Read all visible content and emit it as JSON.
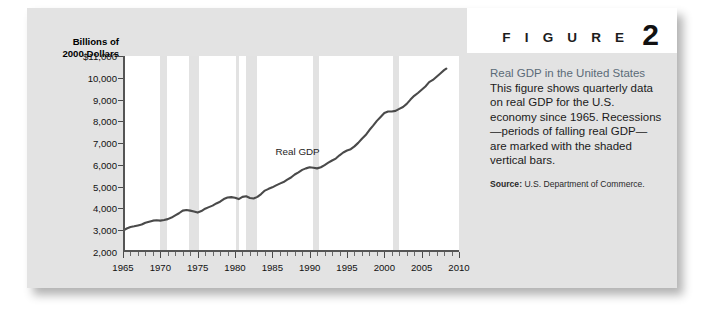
{
  "figure": {
    "word": "F I G U R E",
    "number": "2"
  },
  "caption": {
    "title": "Real GDP in the United States",
    "body": "This figure shows quarterly data on real GDP for the U.S. economy since 1965. Recessions—periods of falling real GDP—are marked with the shaded vertical bars.",
    "source_label": "Source:",
    "source_text": " U.S. Department of Commerce."
  },
  "chart_data": {
    "type": "line",
    "title": "Real GDP in the United States",
    "xlabel": "",
    "ylabel": "Billions of 2000 Dollars",
    "ylabel_line1": "Billions of",
    "ylabel_line2": "2000 Dollars",
    "series_label": "Real GDP",
    "xlim": [
      1965,
      2010
    ],
    "ylim": [
      2000,
      11000
    ],
    "xticks": [
      1965,
      1970,
      1975,
      1980,
      1985,
      1990,
      1995,
      2000,
      2005,
      2010
    ],
    "xtick_labels": [
      "1965",
      "1970",
      "1975",
      "1980",
      "1985",
      "1990",
      "1995",
      "2000",
      "2005",
      "2010"
    ],
    "yticks": [
      2000,
      3000,
      4000,
      5000,
      6000,
      7000,
      8000,
      9000,
      10000,
      11000
    ],
    "ytick_labels": [
      "2,000",
      "3,000",
      "4,000",
      "5,000",
      "6,000",
      "7,000",
      "8,000",
      "9,000",
      "10,000",
      "$11,000"
    ],
    "grid": false,
    "legend": "inline",
    "line_color": "#4a4a4a",
    "recession_color": "#e2e2e2",
    "recession_bands": [
      {
        "start": 1969.9,
        "end": 1970.9,
        "label": "1970 recession"
      },
      {
        "start": 1973.9,
        "end": 1975.2,
        "label": "1973-75 recession"
      },
      {
        "start": 1980.1,
        "end": 1980.6,
        "label": "1980 recession"
      },
      {
        "start": 1981.5,
        "end": 1982.9,
        "label": "1981-82 recession"
      },
      {
        "start": 1990.5,
        "end": 1991.2,
        "label": "1990-91 recession"
      },
      {
        "start": 2001.2,
        "end": 2001.9,
        "label": "2001 recession"
      }
    ],
    "x": [
      1965.0,
      1965.5,
      1966.0,
      1966.5,
      1967.0,
      1967.5,
      1968.0,
      1968.5,
      1969.0,
      1969.5,
      1970.0,
      1970.5,
      1971.0,
      1971.5,
      1972.0,
      1972.5,
      1973.0,
      1973.5,
      1974.0,
      1974.5,
      1975.0,
      1975.5,
      1976.0,
      1976.5,
      1977.0,
      1977.5,
      1978.0,
      1978.5,
      1979.0,
      1979.5,
      1980.0,
      1980.5,
      1981.0,
      1981.5,
      1982.0,
      1982.5,
      1983.0,
      1983.5,
      1984.0,
      1984.5,
      1985.0,
      1985.5,
      1986.0,
      1986.5,
      1987.0,
      1987.5,
      1988.0,
      1988.5,
      1989.0,
      1989.5,
      1990.0,
      1990.5,
      1991.0,
      1991.5,
      1992.0,
      1992.5,
      1993.0,
      1993.5,
      1994.0,
      1994.5,
      1995.0,
      1995.5,
      1996.0,
      1996.5,
      1997.0,
      1997.5,
      1998.0,
      1998.5,
      1999.0,
      1999.5,
      2000.0,
      2000.5,
      2001.0,
      2001.5,
      2002.0,
      2002.5,
      2003.0,
      2003.5,
      2004.0,
      2004.5,
      2005.0,
      2005.5,
      2006.0,
      2006.5,
      2007.0,
      2007.5,
      2008.0,
      2008.3
    ],
    "values": [
      2980,
      3080,
      3150,
      3180,
      3220,
      3260,
      3340,
      3390,
      3440,
      3460,
      3440,
      3470,
      3510,
      3580,
      3680,
      3780,
      3900,
      3930,
      3900,
      3860,
      3810,
      3880,
      3990,
      4060,
      4130,
      4230,
      4310,
      4430,
      4500,
      4520,
      4490,
      4430,
      4530,
      4560,
      4480,
      4460,
      4530,
      4660,
      4820,
      4900,
      4970,
      5060,
      5140,
      5210,
      5320,
      5420,
      5560,
      5660,
      5770,
      5840,
      5890,
      5870,
      5840,
      5890,
      5990,
      6100,
      6200,
      6290,
      6440,
      6570,
      6660,
      6720,
      6850,
      7010,
      7200,
      7370,
      7600,
      7800,
      8020,
      8200,
      8380,
      8450,
      8450,
      8480,
      8570,
      8660,
      8800,
      9000,
      9170,
      9300,
      9450,
      9600,
      9800,
      9900,
      10050,
      10200,
      10350,
      10420
    ]
  }
}
